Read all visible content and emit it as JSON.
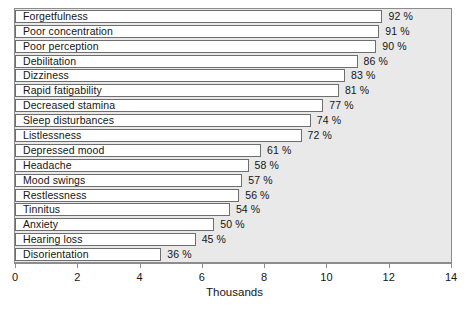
{
  "chart_data": {
    "type": "bar",
    "orientation": "horizontal",
    "title": "",
    "xlabel": "Thousands",
    "ylabel": "",
    "xlim": [
      0,
      14
    ],
    "xticks": [
      0,
      2,
      4,
      6,
      8,
      10,
      12,
      14
    ],
    "xtick_labels": [
      "0",
      "2",
      "4",
      "6",
      "8",
      "10",
      "12",
      "14"
    ],
    "grid": false,
    "legend": null,
    "categories": [
      "Forgetfulness",
      "Poor concentration",
      "Poor perception",
      "Debilitation",
      "Dizziness",
      "Rapid fatigability",
      "Decreased stamina",
      "Sleep disturbances",
      "Listlessness",
      "Depressed mood",
      "Headache",
      "Mood swings",
      "Restlessness",
      "Tinnitus",
      "Anxiety",
      "Hearing loss",
      "Disorientation"
    ],
    "values": [
      11.8,
      11.7,
      11.6,
      11.0,
      10.6,
      10.4,
      9.9,
      9.5,
      9.2,
      7.9,
      7.5,
      7.3,
      7.2,
      6.9,
      6.4,
      5.8,
      4.7
    ],
    "percent_labels": [
      "92 %",
      "91 %",
      "90 %",
      "86 %",
      "83 %",
      "81 %",
      "77 %",
      "74 %",
      "72 %",
      "61 %",
      "58 %",
      "57 %",
      "56 %",
      "54 %",
      "50 %",
      "45 %",
      "36 %"
    ],
    "percents": [
      92,
      91,
      90,
      86,
      83,
      81,
      77,
      74,
      72,
      61,
      58,
      57,
      56,
      54,
      50,
      45,
      36
    ],
    "colors": {
      "plot_background": "#e9e9e9",
      "bar_fill": "#ffffff",
      "bar_border": "#6e6e6e",
      "axis": "#8c8c8c",
      "text": "#151515"
    }
  }
}
